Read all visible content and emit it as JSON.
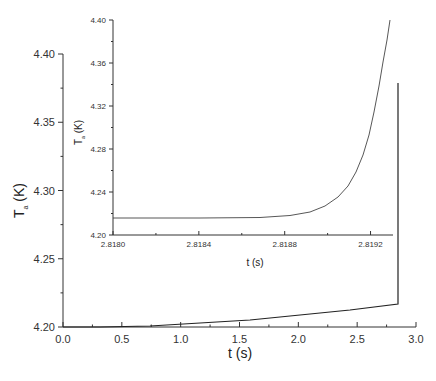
{
  "chart_data": [
    {
      "name": "main",
      "type": "line",
      "title": "",
      "xlabel": "t (s)",
      "ylabel": "T_a (K)",
      "xlim": [
        0.0,
        3.0
      ],
      "ylim": [
        4.2,
        4.4
      ],
      "xticks": [
        "0.0",
        "0.5",
        "1.0",
        "1.5",
        "2.0",
        "2.5",
        "3.0"
      ],
      "yticks": [
        "4.20",
        "4.25",
        "4.30",
        "4.35",
        "4.40"
      ],
      "grid": false,
      "series": [
        {
          "name": "T_a",
          "x": [
            0.0,
            0.5,
            1.0,
            1.5,
            2.0,
            2.5,
            2.8193,
            2.8193
          ],
          "y": [
            4.2,
            4.201,
            4.204,
            4.207,
            4.21,
            4.214,
            4.217,
            4.367
          ]
        }
      ]
    },
    {
      "name": "inset",
      "type": "line",
      "title": "",
      "xlabel": "t (s)",
      "ylabel": "T_a (K)",
      "xlim": [
        2.818,
        2.8193
      ],
      "ylim": [
        4.2,
        4.4
      ],
      "xticks": [
        "2.8180",
        "2.8184",
        "2.8188",
        "2.8192"
      ],
      "yticks": [
        "4.20",
        "4.24",
        "4.28",
        "4.32",
        "4.36",
        "4.40"
      ],
      "grid": false,
      "series": [
        {
          "name": "T_a",
          "x": [
            2.818,
            2.8184,
            2.8188,
            2.819,
            2.81915,
            2.8192,
            2.81925,
            2.8193
          ],
          "y": [
            4.217,
            4.217,
            4.218,
            4.22,
            4.228,
            4.26,
            4.31,
            4.4
          ]
        }
      ]
    }
  ],
  "labels": {
    "main_x": "t (s)",
    "main_y_main": "T",
    "main_y_sub": "a",
    "main_y_unit": " (K)",
    "inset_x": "t (s)",
    "inset_y_main": "T",
    "inset_y_sub": "a",
    "inset_y_unit": " (K)"
  }
}
